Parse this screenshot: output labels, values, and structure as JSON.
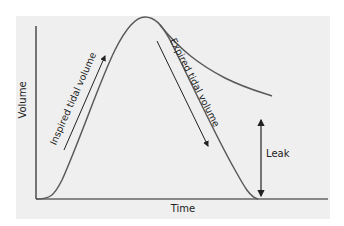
{
  "diagram": {
    "axes": {
      "x_label": "Time",
      "y_label": "Volume"
    },
    "annotations": {
      "inspired": "Inspired tidal volume",
      "expired": "Expired tidal volume",
      "leak": "Leak"
    },
    "colors": {
      "background": "#efefef",
      "curve": "#5a5a5a",
      "axis": "#222222",
      "arrow": "#222222"
    }
  }
}
